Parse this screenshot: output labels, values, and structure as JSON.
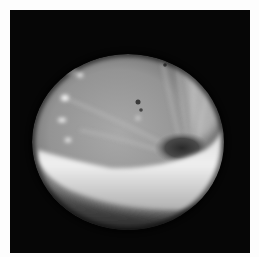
{
  "image": {
    "kind": "grayscale endoscopic photograph",
    "background_color": "#fdfdfd",
    "frame_color": "#060606",
    "colors": {
      "mucosa_mid": "#9a9a9a",
      "fold_bright": "#e6e6e6",
      "lumen_dark": "#2e2e2e",
      "highlight": "#ffffff"
    }
  }
}
